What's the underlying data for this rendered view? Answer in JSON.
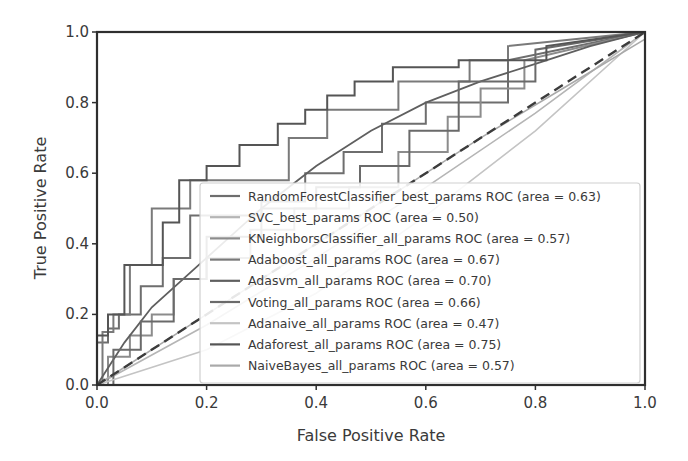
{
  "chart_data": {
    "type": "line",
    "title": "",
    "xlabel": "False Positive Rate",
    "ylabel": "True Positive Rate",
    "xlim": [
      0.0,
      1.0
    ],
    "ylim": [
      0.0,
      1.0
    ],
    "xticks": [
      "0.0",
      "0.2",
      "0.4",
      "0.6",
      "0.8",
      "1.0"
    ],
    "yticks": [
      "0.0",
      "0.2",
      "0.4",
      "0.6",
      "0.8",
      "1.0"
    ],
    "grid": false,
    "legend_position": "lower right",
    "baseline": {
      "name": "chance",
      "style": "dashed",
      "x": [
        0,
        1
      ],
      "y": [
        0,
        1
      ]
    },
    "series": [
      {
        "name": "RandomForestClassifier_best_params ROC (area = 0.63)",
        "auc": 0.63,
        "color": "#6e6e6e",
        "width": 2,
        "x": [
          0,
          0,
          0.02,
          0.02,
          0.04,
          0.04,
          0.08,
          0.08,
          0.12,
          0.12,
          0.17,
          0.17,
          0.3,
          0.3,
          0.38,
          0.38,
          0.45,
          0.45,
          0.52,
          0.52,
          0.6,
          0.6,
          0.75,
          0.75,
          1
        ],
        "y": [
          0,
          0.12,
          0.12,
          0.16,
          0.16,
          0.2,
          0.2,
          0.28,
          0.28,
          0.36,
          0.36,
          0.48,
          0.48,
          0.52,
          0.52,
          0.6,
          0.6,
          0.66,
          0.66,
          0.74,
          0.74,
          0.8,
          0.8,
          0.92,
          1
        ]
      },
      {
        "name": "SVC_best_params ROC (area = 0.50)",
        "auc": 0.5,
        "color": "#b5b5b5",
        "width": 1.6,
        "x": [
          0,
          0.2,
          0.4,
          0.6,
          0.8,
          1
        ],
        "y": [
          0,
          0.17,
          0.36,
          0.56,
          0.77,
          1
        ]
      },
      {
        "name": "KNeighborsClassifier_all_params ROC (area = 0.57)",
        "auc": 0.57,
        "color": "#8c8c8c",
        "width": 2,
        "x": [
          0,
          0.02,
          0.02,
          0.06,
          0.06,
          0.1,
          0.1,
          0.14,
          0.14,
          0.2,
          0.2,
          0.28,
          0.28,
          0.36,
          0.36,
          0.46,
          0.46,
          0.55,
          0.55,
          0.64,
          0.64,
          0.7,
          0.7,
          0.78,
          0.78,
          1
        ],
        "y": [
          0,
          0,
          0.08,
          0.08,
          0.14,
          0.14,
          0.2,
          0.2,
          0.3,
          0.3,
          0.36,
          0.36,
          0.44,
          0.44,
          0.5,
          0.5,
          0.56,
          0.56,
          0.66,
          0.66,
          0.76,
          0.76,
          0.84,
          0.84,
          0.92,
          1
        ]
      },
      {
        "name": "Adaboost_all_params ROC (area = 0.67)",
        "auc": 0.67,
        "color": "#7a7a7a",
        "width": 2,
        "x": [
          0,
          0.01,
          0.01,
          0.03,
          0.03,
          0.06,
          0.06,
          0.1,
          0.1,
          0.17,
          0.17,
          0.35,
          0.35,
          0.42,
          0.42,
          0.55,
          0.55,
          0.68,
          0.68,
          0.75,
          0.75,
          1
        ],
        "y": [
          0,
          0,
          0.15,
          0.15,
          0.2,
          0.2,
          0.34,
          0.34,
          0.5,
          0.5,
          0.58,
          0.58,
          0.7,
          0.7,
          0.78,
          0.78,
          0.86,
          0.86,
          0.92,
          0.92,
          0.96,
          1
        ]
      },
      {
        "name": "Adasvm_all_params ROC (area = 0.70)",
        "auc": 0.7,
        "color": "#5f5f5f",
        "width": 1.8,
        "x": [
          0,
          0.05,
          0.1,
          0.2,
          0.3,
          0.4,
          0.5,
          0.6,
          0.7,
          0.8,
          0.9,
          1
        ],
        "y": [
          0,
          0.12,
          0.22,
          0.36,
          0.5,
          0.62,
          0.72,
          0.8,
          0.86,
          0.91,
          0.96,
          1
        ]
      },
      {
        "name": "Voting_all_params ROC (area = 0.66)",
        "auc": 0.66,
        "color": "#6a6a6a",
        "width": 2,
        "x": [
          0,
          0.03,
          0.03,
          0.08,
          0.08,
          0.14,
          0.14,
          0.2,
          0.2,
          0.3,
          0.3,
          0.4,
          0.4,
          0.48,
          0.48,
          0.57,
          0.57,
          0.66,
          0.66,
          0.8,
          0.8,
          1
        ],
        "y": [
          0,
          0,
          0.1,
          0.1,
          0.18,
          0.18,
          0.3,
          0.3,
          0.42,
          0.42,
          0.5,
          0.5,
          0.56,
          0.56,
          0.62,
          0.62,
          0.72,
          0.72,
          0.86,
          0.86,
          0.95,
          1
        ]
      },
      {
        "name": "Adanaive_all_params ROC (area = 0.47)",
        "auc": 0.47,
        "color": "#c4c4c4",
        "width": 1.6,
        "x": [
          0,
          0.2,
          0.4,
          0.6,
          0.8,
          1
        ],
        "y": [
          0,
          0.1,
          0.26,
          0.48,
          0.72,
          1
        ]
      },
      {
        "name": "Adaforest_all_params ROC (area = 0.75)",
        "auc": 0.75,
        "color": "#555555",
        "width": 2,
        "x": [
          0,
          0,
          0.02,
          0.02,
          0.05,
          0.05,
          0.12,
          0.12,
          0.15,
          0.15,
          0.2,
          0.2,
          0.26,
          0.26,
          0.33,
          0.33,
          0.38,
          0.38,
          0.42,
          0.42,
          0.47,
          0.47,
          0.54,
          0.54,
          0.66,
          0.66,
          0.82,
          0.82,
          1
        ],
        "y": [
          0,
          0.14,
          0.14,
          0.2,
          0.2,
          0.34,
          0.34,
          0.46,
          0.46,
          0.58,
          0.58,
          0.62,
          0.62,
          0.68,
          0.68,
          0.74,
          0.74,
          0.78,
          0.78,
          0.82,
          0.82,
          0.86,
          0.86,
          0.9,
          0.9,
          0.92,
          0.92,
          0.96,
          1
        ]
      },
      {
        "name": "NaiveBayes_all_params ROC (area = 0.57)",
        "auc": 0.57,
        "color": "#a9a9a9",
        "width": 1.6,
        "x": [
          0,
          0.2,
          0.4,
          0.55,
          0.7,
          0.85,
          1
        ],
        "y": [
          0,
          0.2,
          0.4,
          0.55,
          0.7,
          0.84,
          0.98
        ]
      }
    ]
  }
}
